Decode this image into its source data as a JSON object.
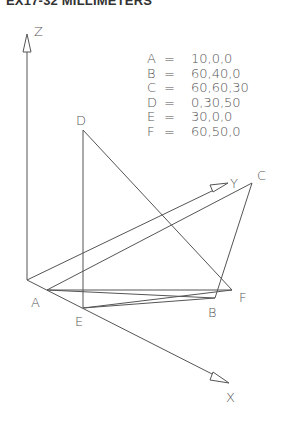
{
  "title": "EX17-32 MILLIMETERS",
  "axes": {
    "z_label": "Z",
    "y_label": "Y",
    "x_label": "X"
  },
  "points_table": [
    {
      "label": "A",
      "eq": "=",
      "value": "10,0,0"
    },
    {
      "label": "B",
      "eq": "=",
      "value": "60,40,0"
    },
    {
      "label": "C",
      "eq": "=",
      "value": "60,60,30"
    },
    {
      "label": "D",
      "eq": "=",
      "value": "0,30,50"
    },
    {
      "label": "E",
      "eq": "=",
      "value": "30,0,0"
    },
    {
      "label": "F",
      "eq": "=",
      "value": "60,50,0"
    }
  ],
  "point_labels": {
    "A": "A",
    "B": "B",
    "C": "C",
    "D": "D",
    "E": "E",
    "F": "F"
  },
  "colors": {
    "line": "#555555",
    "text": "#555555",
    "title": "#333333"
  }
}
